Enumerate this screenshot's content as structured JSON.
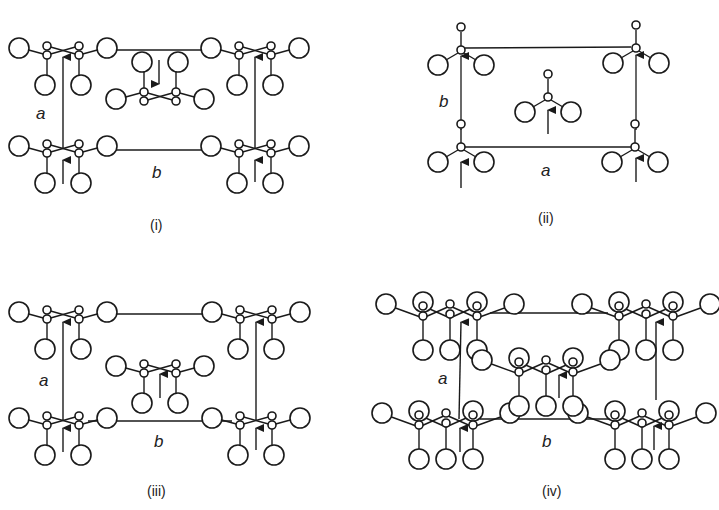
{
  "figure": {
    "panels": [
      {
        "id": "i",
        "caption": "(i)",
        "axis_vertical": "a",
        "axis_horizontal": "b",
        "motif": "dimer-4-arm",
        "center_orientation": "inverted"
      },
      {
        "id": "ii",
        "caption": "(ii)",
        "axis_vertical": "b",
        "axis_horizontal": "a",
        "motif": "trigonal-3-arm",
        "center_orientation": "same"
      },
      {
        "id": "iii",
        "caption": "(iii)",
        "axis_vertical": "a",
        "axis_horizontal": "b",
        "motif": "dimer-4-arm",
        "center_orientation": "same"
      },
      {
        "id": "iv",
        "caption": "(iv)",
        "axis_vertical": "a",
        "axis_horizontal": "b",
        "motif": "trimer-chain",
        "center_orientation": "same"
      }
    ]
  },
  "colors": {
    "ink": "#1a1a1a",
    "background": "#ffffff"
  }
}
